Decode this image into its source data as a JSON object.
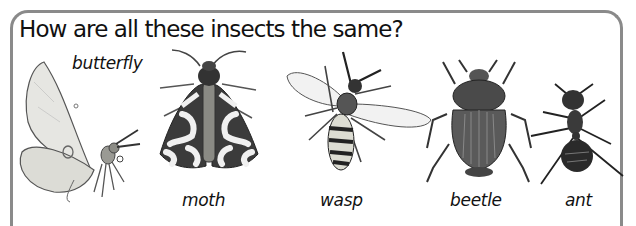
{
  "worksheet": {
    "question": "How are all these insects the same?",
    "insects": [
      {
        "name": "butterfly",
        "label": "butterfly"
      },
      {
        "name": "moth",
        "label": "moth"
      },
      {
        "name": "wasp",
        "label": "wasp"
      },
      {
        "name": "beetle",
        "label": "beetle"
      },
      {
        "name": "ant",
        "label": "ant"
      }
    ]
  },
  "colors": {
    "frame": "#8a8a8a",
    "text": "#111111",
    "background": "#ffffff"
  }
}
